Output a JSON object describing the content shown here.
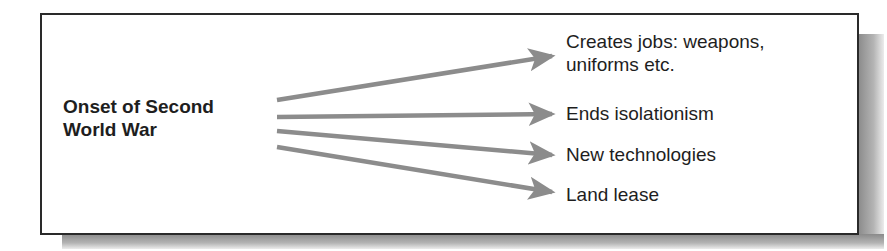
{
  "diagram": {
    "type": "cause-effect",
    "source": {
      "line1": "Onset of Second",
      "line2": "World War"
    },
    "effects": [
      {
        "line1": "Creates jobs: weapons,",
        "line2": "uniforms etc."
      },
      {
        "line1": "Ends isolationism"
      },
      {
        "line1": "New technologies"
      },
      {
        "line1": "Land lease"
      }
    ],
    "colors": {
      "arrow": "#8c8c8c",
      "border": "#2a2a2a",
      "text": "#1e1e1e",
      "shadow": "#9a9a9a"
    }
  }
}
